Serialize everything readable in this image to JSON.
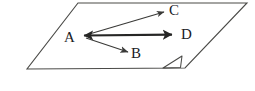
{
  "figure": {
    "kind": "geometry-diagram",
    "background_color": "#ffffff",
    "stroke_color": "#3a3a38",
    "label_color": "#20201f",
    "plane": {
      "name": "plane",
      "corners": [
        {
          "x": 78,
          "y": 3
        },
        {
          "x": 247,
          "y": 3
        },
        {
          "x": 185,
          "y": 68
        },
        {
          "x": 27,
          "y": 69
        }
      ],
      "stroke_width": 1.1
    },
    "corner_mark": {
      "name": "folded-corner-mark",
      "path": "M 162 68 L 182 56 L 180 67 Z",
      "stroke_width": 1.1
    },
    "origin": {
      "x": 85,
      "y": 36
    },
    "vectors": [
      {
        "id": "AC",
        "name": "vector-a-to-c",
        "from": {
          "x": 86,
          "y": 35
        },
        "to": {
          "x": 166,
          "y": 12
        },
        "stroke_width": 1.2,
        "double_headed": false,
        "head_size": 6.5
      },
      {
        "id": "AD",
        "name": "vector-a-to-d",
        "from": {
          "x": 82,
          "y": 36
        },
        "to": {
          "x": 178,
          "y": 35
        },
        "stroke_width": 2.1,
        "double_headed": true,
        "head_size": 8
      },
      {
        "id": "AB",
        "name": "vector-a-to-b",
        "from": {
          "x": 86,
          "y": 38
        },
        "to": {
          "x": 130,
          "y": 53
        },
        "stroke_width": 1.3,
        "double_headed": false,
        "head_size": 7
      }
    ],
    "labels": {
      "A": "A",
      "B": "B",
      "C": "C",
      "D": "D"
    }
  }
}
